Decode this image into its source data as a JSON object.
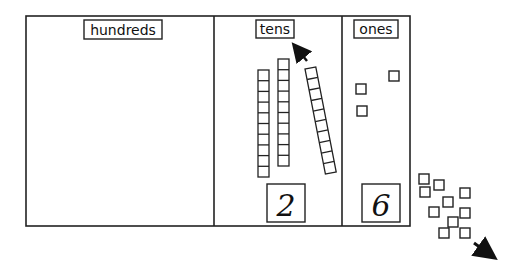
{
  "diagram": {
    "type": "place-value-chart",
    "columns": [
      {
        "label": "hundreds",
        "digit": ""
      },
      {
        "label": "tens",
        "digit": "2",
        "rods_inside": 3
      },
      {
        "label": "ones",
        "digit": "6",
        "cubes_inside": 3
      }
    ],
    "loose_cubes_outside": 10,
    "arrows": [
      {
        "location": "tens column",
        "direction": "up-left"
      },
      {
        "location": "bottom-right",
        "direction": "down-right"
      }
    ],
    "colors": {
      "ink": "#111111",
      "background": "#ffffff"
    }
  }
}
